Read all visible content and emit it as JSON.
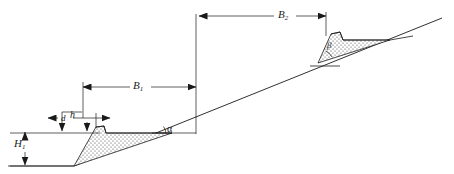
{
  "figure": {
    "type": "engineering-slope-cross-section",
    "title": "",
    "background_color": "#ffffff",
    "line_color": "#1a1a1a",
    "fill_pattern": "stipple-dots"
  },
  "labels": {
    "b1": "B",
    "b1_sub": "1",
    "b2": "B",
    "b2_sub": "2",
    "h1": "H",
    "h1_sub": "1",
    "h": "h",
    "d": "d",
    "alpha": "α",
    "beta": "β"
  },
  "dimensions": {
    "b1_label": "B1",
    "b2_label": "B2",
    "h1_label": "H1",
    "h_label": "h",
    "d_label": "d"
  },
  "angles": {
    "slope_angle": "α",
    "bench_angle": "β"
  },
  "elements": {
    "ground_slope": "ground-slope-line",
    "lower_bench": "lower-bench-fill",
    "upper_bench": "upper-bench-fill",
    "b1_dimension": "b1-dimension-line",
    "b2_dimension": "b2-dimension-line",
    "h1_dimension": "h1-dimension-line",
    "h_dimension": "h-dimension-line",
    "d_dimension": "d-dimension-line"
  }
}
